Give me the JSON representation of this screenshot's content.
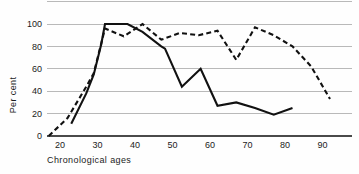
{
  "chart_data": {
    "type": "line",
    "title": "",
    "xlabel": "Chronological ages",
    "ylabel": "Per cent",
    "xlim": [
      15,
      95
    ],
    "ylim": [
      0,
      120
    ],
    "xticks": [
      20,
      30,
      40,
      50,
      60,
      70,
      80,
      90
    ],
    "xtick_labels": [
      "20",
      "30",
      "40",
      "50",
      "60",
      "70",
      "80",
      "90"
    ],
    "yticks": [
      0,
      20,
      40,
      60,
      80,
      100
    ],
    "ytick_labels": [
      "0",
      "20",
      "40",
      "60",
      "80",
      "100"
    ],
    "extra_gridlines": [
      120
    ],
    "grid": true,
    "legend": "none",
    "series": [
      {
        "name": "solid",
        "style": "solid",
        "x": [
          23,
          27,
          29,
          31,
          32,
          38,
          42,
          47,
          48,
          52.5,
          57.5,
          62,
          67,
          72,
          77,
          82
        ],
        "values": [
          11,
          38,
          55,
          82,
          100,
          100,
          93,
          80,
          78,
          44,
          60,
          27,
          30,
          25,
          19,
          25
        ]
      },
      {
        "name": "dashed",
        "style": "dashed",
        "x": [
          17,
          22,
          27,
          29,
          32,
          37,
          42,
          47,
          52,
          57,
          62,
          67,
          72,
          77,
          82,
          87,
          92
        ],
        "values": [
          0,
          16,
          44,
          56,
          96,
          89,
          100,
          86,
          92,
          90,
          94,
          68,
          97,
          90,
          80,
          62,
          33
        ]
      }
    ]
  }
}
